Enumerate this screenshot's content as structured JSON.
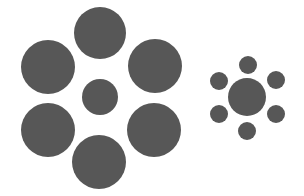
{
  "figure": {
    "title": "",
    "fill_color": "#575757",
    "background_color": "#ffffff"
  },
  "groups": [
    {
      "name": "left-cluster",
      "center": {
        "cx": 100,
        "cy": 97,
        "r": 18
      },
      "surround": [
        {
          "cx": 100,
          "cy": 33,
          "r": 26
        },
        {
          "cx": 155,
          "cy": 66,
          "r": 27
        },
        {
          "cx": 154,
          "cy": 130,
          "r": 27
        },
        {
          "cx": 99,
          "cy": 162,
          "r": 27
        },
        {
          "cx": 48,
          "cy": 130,
          "r": 27
        },
        {
          "cx": 48,
          "cy": 67,
          "r": 27
        }
      ]
    },
    {
      "name": "right-cluster",
      "center": {
        "cx": 247,
        "cy": 97,
        "r": 19
      },
      "surround": [
        {
          "cx": 248,
          "cy": 65,
          "r": 9
        },
        {
          "cx": 276,
          "cy": 80,
          "r": 9
        },
        {
          "cx": 276,
          "cy": 114,
          "r": 9
        },
        {
          "cx": 247,
          "cy": 131,
          "r": 9
        },
        {
          "cx": 219,
          "cy": 114,
          "r": 9
        },
        {
          "cx": 219,
          "cy": 81,
          "r": 9
        }
      ]
    }
  ]
}
